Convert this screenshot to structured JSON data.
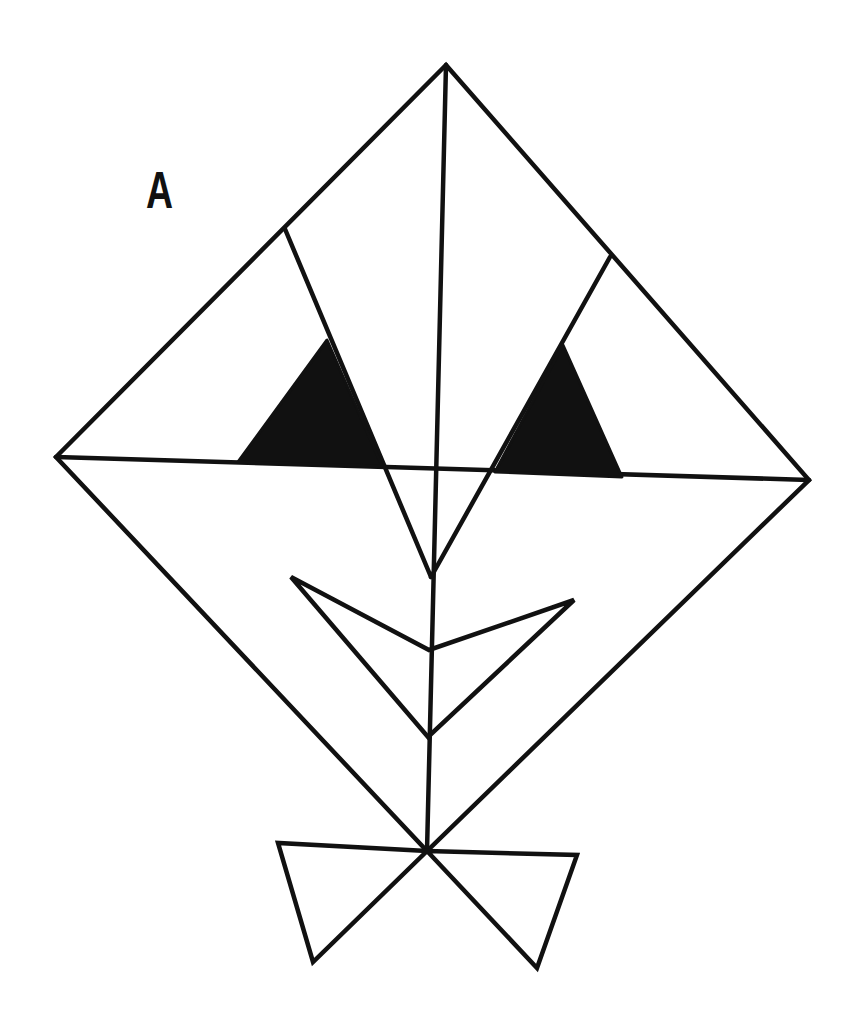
{
  "figure": {
    "label": "A",
    "colors": {
      "stroke": "#111111",
      "fill": "#111111",
      "background": "#ffffff"
    },
    "stroke_width": 4.5
  },
  "shapes": {
    "kite_outline": {
      "points": [
        [
          446,
          65
        ],
        [
          809,
          480
        ],
        [
          427,
          851
        ],
        [
          56,
          457
        ]
      ]
    },
    "horizontal_line": {
      "points": [
        [
          56,
          457
        ],
        [
          809,
          480
        ]
      ]
    },
    "vertical_line": {
      "points": [
        [
          446,
          65
        ],
        [
          427,
          851
        ]
      ]
    },
    "left_brow_line": {
      "points": [
        [
          285,
          229
        ],
        [
          431,
          577
        ]
      ]
    },
    "right_brow_line": {
      "points": [
        [
          610,
          257
        ],
        [
          431,
          577
        ]
      ]
    },
    "left_eye": {
      "points": [
        [
          327,
          340
        ],
        [
          238,
          462
        ],
        [
          382,
          466
        ]
      ]
    },
    "right_eye": {
      "points": [
        [
          563,
          345
        ],
        [
          495,
          472
        ],
        [
          622,
          477
        ]
      ]
    },
    "mouth": {
      "points": [
        [
          291,
          577
        ],
        [
          429,
          650
        ],
        [
          574,
          600
        ],
        [
          428,
          737
        ]
      ]
    },
    "bow_left": {
      "points": [
        [
          427,
          851
        ],
        [
          278,
          843
        ],
        [
          313,
          962
        ]
      ]
    },
    "bow_right": {
      "points": [
        [
          427,
          851
        ],
        [
          577,
          855
        ],
        [
          537,
          968
        ]
      ]
    }
  }
}
